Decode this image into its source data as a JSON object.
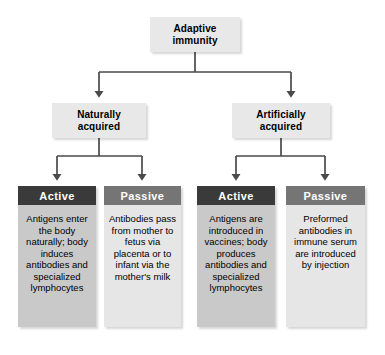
{
  "diagram": {
    "type": "hierarchy-flowchart",
    "title_node": "Adaptive immunity",
    "colors": {
      "active_header": "#3a3a3a",
      "passive_header": "#757575",
      "active_body": "#c9c9c9",
      "passive_body": "#e6e6e6",
      "tier_box": "#e8e8e8",
      "connector": "#4a4a4a",
      "background": "#ffffff"
    }
  },
  "root": {
    "label": "Adaptive\nimmunity",
    "line1": "Adaptive",
    "line2": "immunity"
  },
  "tier2": [
    {
      "id": "naturally-acquired",
      "line1": "Naturally",
      "line2": "acquired"
    },
    {
      "id": "artificially-acquired",
      "line1": "Artificially",
      "line2": "acquired"
    }
  ],
  "columns": [
    {
      "id": "naturally-acquired-active",
      "header": "Active",
      "variant": "active",
      "parent": "Naturally acquired",
      "body": "Antigens enter the body naturally; body induces antibodies and specialized lymphocytes"
    },
    {
      "id": "naturally-acquired-passive",
      "header": "Passive",
      "variant": "passive",
      "parent": "Naturally acquired",
      "body": "Antibodies pass from mother to fetus via placenta or to infant via the mother's milk"
    },
    {
      "id": "artificially-acquired-active",
      "header": "Active",
      "variant": "active",
      "parent": "Artificially acquired",
      "body": "Antigens are introduced in vaccines; body produces antibodies and specialized lymphocytes"
    },
    {
      "id": "artificially-acquired-passive",
      "header": "Passive",
      "variant": "passive",
      "parent": "Artificially acquired",
      "body": "Preformed antibodies in immune serum are introduced by injection"
    }
  ]
}
